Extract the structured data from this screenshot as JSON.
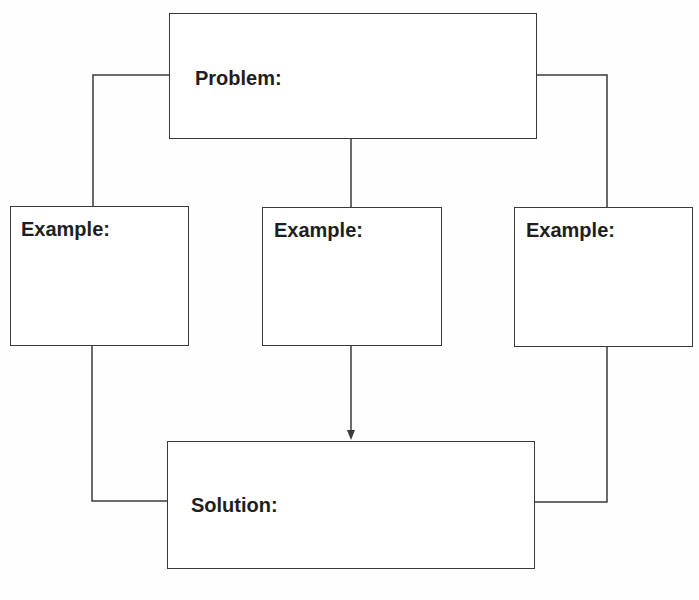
{
  "diagram": {
    "type": "graphic-organizer",
    "problem": {
      "label": "Problem:"
    },
    "examples": [
      {
        "label": "Example:"
      },
      {
        "label": "Example:"
      },
      {
        "label": "Example:"
      }
    ],
    "solution": {
      "label": "Solution:"
    },
    "colors": {
      "line": "#3a3a3a",
      "text": "#1e1e1e",
      "background": "#ffffff"
    },
    "connections": [
      {
        "from": "problem",
        "to": "example-1",
        "style": "line"
      },
      {
        "from": "problem",
        "to": "example-2",
        "style": "line"
      },
      {
        "from": "problem",
        "to": "example-3",
        "style": "line"
      },
      {
        "from": "example-1",
        "to": "solution",
        "style": "line"
      },
      {
        "from": "example-2",
        "to": "solution",
        "style": "arrow"
      },
      {
        "from": "example-3",
        "to": "solution",
        "style": "line"
      }
    ]
  }
}
